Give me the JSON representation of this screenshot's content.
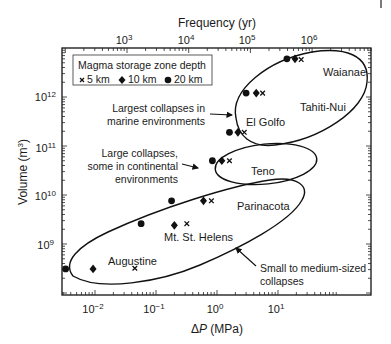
{
  "chart_data": {
    "type": "scatter",
    "title": "",
    "xlabel": "ΔP (MPa)",
    "ylabel": "Volume (m³)",
    "top_xlabel": "Frequency (yr)",
    "xscale": "log",
    "yscale": "log",
    "xlim": [
      0.0018,
      60
    ],
    "ylim": [
      110000000.0,
      4500000000000.0
    ],
    "x_ticks": [
      "10⁻²",
      "10⁻¹",
      "10⁰",
      "10¹"
    ],
    "x_tick_values": [
      0.01,
      0.1,
      1,
      10
    ],
    "top_ticks": [
      "10³",
      "10⁴",
      "10⁵",
      "10⁶"
    ],
    "y_ticks": [
      "10⁹",
      "10¹⁰",
      "10¹¹",
      "10¹²"
    ],
    "y_tick_values": [
      1000000000.0,
      10000000000.0,
      100000000000.0,
      1000000000000.0
    ],
    "grid": false,
    "legend": {
      "title": "Magma storage zone depth",
      "position": "upper left",
      "entries": [
        {
          "marker": "x",
          "label": "5 km"
        },
        {
          "marker": "diamond",
          "label": "10 km"
        },
        {
          "marker": "circle",
          "label": "20 km"
        }
      ]
    },
    "series": [
      {
        "name": "5 km",
        "marker": "x",
        "points": [
          {
            "label": "Waianae",
            "x": 24,
            "y": 5800000000000.0
          },
          {
            "label": "Tahiti-Nui",
            "x": 5.6,
            "y": 1200000000000.0
          },
          {
            "label": "El Golfo",
            "x": 2.8,
            "y": 190000000000.0
          },
          {
            "label": "Teno",
            "x": 1.6,
            "y": 50000000000.0
          },
          {
            "label": "Parinacota",
            "x": 0.81,
            "y": 7600000000.0
          },
          {
            "label": "Mt. St. Helens",
            "x": 0.32,
            "y": 2600000000.0
          },
          {
            "label": "Augustine",
            "x": 0.045,
            "y": 320000000.0
          }
        ]
      },
      {
        "name": "10 km",
        "marker": "diamond",
        "points": [
          {
            "label": "Waianae",
            "x": 19,
            "y": 6000000000000.0
          },
          {
            "label": "Tahiti-Nui",
            "x": 4.4,
            "y": 1200000000000.0
          },
          {
            "label": "El Golfo",
            "x": 2.2,
            "y": 190000000000.0
          },
          {
            "label": "Teno",
            "x": 1.2,
            "y": 50000000000.0
          },
          {
            "label": "Parinacota",
            "x": 0.6,
            "y": 7600000000.0
          },
          {
            "label": "Mt. St. Helens",
            "x": 0.2,
            "y": 2400000000.0
          },
          {
            "label": "Augustine",
            "x": 0.0093,
            "y": 310000000.0
          }
        ]
      },
      {
        "name": "20 km",
        "marker": "circle",
        "points": [
          {
            "label": "Waianae",
            "x": 14,
            "y": 6000000000000.0
          },
          {
            "label": "Tahiti-Nui",
            "x": 3.0,
            "y": 1200000000000.0
          },
          {
            "label": "El Golfo",
            "x": 1.6,
            "y": 190000000000.0
          },
          {
            "label": "Teno",
            "x": 0.84,
            "y": 50000000000.0
          },
          {
            "label": "Parinacota",
            "x": 0.18,
            "y": 7600000000.0
          },
          {
            "label": "Mt. St. Helens",
            "x": 0.057,
            "y": 2600000000.0
          },
          {
            "label": "Augustine",
            "x": 0.0033,
            "y": 310000000.0
          }
        ]
      }
    ],
    "annotations": [
      {
        "text": "Largest collapses in marine environments",
        "points_to": "upper ellipse (Waianae, Tahiti-Nui, El Golfo)"
      },
      {
        "text": "Large collapses, some in continental environments",
        "points_to": "middle ellipse (Teno)"
      },
      {
        "text": "Small to medium-sized collapses",
        "points_to": "lower ellipse (Parinacota, Mt. St. Helens, Augustine)"
      }
    ]
  },
  "labels": {
    "top_axis_title": "Frequency (yr)",
    "bottom_axis_title": "(MPa)",
    "delta_symbol": "Δ",
    "p_symbol": "P",
    "y_axis_title": "Volume (m",
    "y_axis_sup": "3",
    "y_axis_close": ")",
    "legend_title": "Magma storage zone depth",
    "legend_5": "5 km",
    "legend_10": "10 km",
    "legend_20": "20 km",
    "top_ticks": [
      {
        "base": "10",
        "exp": "3"
      },
      {
        "base": "10",
        "exp": "4"
      },
      {
        "base": "10",
        "exp": "5"
      },
      {
        "base": "10",
        "exp": "6"
      }
    ],
    "bottom_ticks": [
      {
        "base": "10",
        "exp": "−2"
      },
      {
        "base": "10",
        "exp": "−1"
      },
      {
        "base": "10",
        "exp": "0"
      },
      {
        "base": "10",
        "exp": "1"
      }
    ],
    "left_ticks": [
      {
        "base": "10",
        "exp": "12"
      },
      {
        "base": "10",
        "exp": "11"
      },
      {
        "base": "10",
        "exp": "10"
      },
      {
        "base": "10",
        "exp": "9"
      }
    ],
    "volcanoes": {
      "waianae": "Waianae",
      "tahiti": "Tahiti-Nui",
      "elgolfo": "El Golfo",
      "teno": "Teno",
      "parinacota": "Parinacota",
      "msh": "Mt. St. Helens",
      "augustine": "Augustine"
    },
    "ann_largest_1": "Largest collapses in",
    "ann_largest_2": "marine environments",
    "ann_large_1": "Large collapses,",
    "ann_large_2": "some in continental",
    "ann_large_3": "environments",
    "ann_small_1": "Small to medium-sized",
    "ann_small_2": "collapses"
  }
}
